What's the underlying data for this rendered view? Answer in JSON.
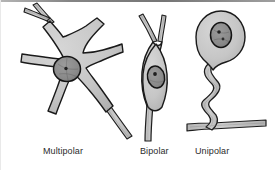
{
  "figure": {
    "kind": "anatomical-illustration",
    "background_color": "#ffffff",
    "ink_color": "#1a1a1a",
    "cytoplasm_color": "#c9c9c9",
    "cytoplasm_shade_color": "#b3b3b3",
    "nucleus_color": "#8a8a8a",
    "nucleolus_color": "#2a2a2a",
    "process_fill_color": "#c4c4c4"
  },
  "labels": {
    "multipolar": "Multipolar",
    "bipolar": "Bipolar",
    "unipolar": "Unipolar"
  },
  "neurons": [
    {
      "id": "multipolar",
      "label": "Multipolar",
      "soma_shape": "star-shaped multi-process soma",
      "process_count": 6,
      "nucleus": {
        "cx": 67,
        "cy": 69,
        "rx": 13,
        "ry": 12,
        "nucleolus_r": 1.6
      },
      "soma_path": "M 66 36 C 74 33 80 31 86 27 C 90 24 94 21 97 19 L 103 24 C 99 28 95 33 91 38 C 87 43 84 48 83 53 C 88 53 95 52 102 50 C 109 48 116 46 121 44 L 122 51 C 116 53 109 56 102 59 C 95 62 89 65 85 68 C 88 73 93 79 98 86 C 103 93 108 100 112 106 L 106 111 C 101 104 95 96 89 89 C 83 82 78 76 73 72 C 70 77 67 84 64 92 C 61 100 58 107 56 113 L 49 110 C 52 103 55 95 58 87 C 61 79 63 73 64 68 C 58 67 50 66 42 65 C 34 64 27 63 22 62 L 23 55 C 29 56 36 57 44 58 C 52 59 59 59 64 59 C 62 54 58 48 54 42 C 50 36 46 31 43 27 L 49 22 C 53 27 58 32 62 38 Z",
      "processes": [
        {
          "name": "dendrite-upper-left-fork-a",
          "path": "M 49 22 C 44 17 39 11 35 6"
        },
        {
          "name": "dendrite-upper-left-fork-b",
          "path": "M 46 19 C 39 17 31 14 24 11"
        },
        {
          "name": "axon-lower-right",
          "path": "M 106 111 C 113 120 120 129 127 139"
        }
      ]
    },
    {
      "id": "bipolar",
      "label": "Bipolar",
      "soma_shape": "fusiform spindle soma with Y-fork dendrite",
      "process_count": 2,
      "nucleus": {
        "cx": 156,
        "cy": 76,
        "rx": 8,
        "ry": 11,
        "nucleolus_r": 1.8
      },
      "soma_path": "M 154 40 C 148 48 144 58 143 70 C 142 82 143 94 146 106 L 166 106 C 169 94 170 82 169 70 C 168 58 164 48 158 40 Z",
      "processes": [
        {
          "name": "dendrite-fork-left",
          "path": "M 154 40 C 150 32 145 24 140 17"
        },
        {
          "name": "dendrite-fork-right",
          "path": "M 158 40 C 160 32 161 24 162 16"
        },
        {
          "name": "axon-descending",
          "path": "M 146 106 C 145 118 145 130 145 140"
        }
      ]
    },
    {
      "id": "unipolar",
      "label": "Unipolar",
      "soma_shape": "round soma with single wavy process and T-branch axon",
      "process_count": 1,
      "nucleus": {
        "cx": 221,
        "cy": 37,
        "rx": 10,
        "ry": 12,
        "nucleolus_r": 1.8
      },
      "soma_path": "M 221 12 C 234 12 244 23 244 37 C 244 49 236 59 225 61 C 218 62 213 64 211 68 C 207 63 200 59 199 47 C 197 31 208 12 221 12 Z",
      "processes": [
        {
          "name": "wavy-process",
          "path": "M 210 66 C 203 74 209 80 214 85 C 219 90 213 96 207 101 C 201 106 208 112 212 117 C 215 121 212 125 208 128"
        },
        {
          "name": "axon-branch-left",
          "path": "M 208 128 C 200 128 193 129 187 130"
        },
        {
          "name": "axon-branch-right",
          "path": "M 208 128 C 225 127 243 126 262 126"
        }
      ]
    }
  ]
}
